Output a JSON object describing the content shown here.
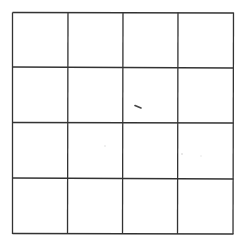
{
  "diagram": {
    "type": "grid",
    "rows": 4,
    "columns": 4,
    "line_color": "#333333",
    "background": "#ffffff",
    "frame": {
      "left": 12.5,
      "top": 12.5,
      "right": 233,
      "bottom": 234
    },
    "vertical_lines_top": [
      12.5,
      68,
      123,
      178,
      233.5
    ],
    "vertical_lines_bottom": [
      12.5,
      67.5,
      122.5,
      177.5,
      233
    ],
    "horizontal_lines_left": [
      12.5,
      67,
      122.5,
      178,
      233.5
    ],
    "horizontal_lines_right": [
      13,
      68,
      123,
      179,
      234
    ],
    "marks": [
      {
        "kind": "dash",
        "x1": 135,
        "y1": 105.5,
        "x2": 141,
        "y2": 108,
        "color": "#444444"
      },
      {
        "kind": "speck",
        "x": 105,
        "y": 146,
        "color": "#dddddd"
      },
      {
        "kind": "speck",
        "x": 182,
        "y": 154,
        "color": "#cccccc"
      },
      {
        "kind": "speck",
        "x": 201,
        "y": 156,
        "color": "#e6e6e6"
      }
    ]
  }
}
